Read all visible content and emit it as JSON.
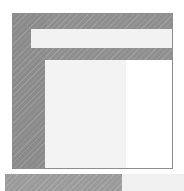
{
  "canvas": {
    "width": 184,
    "height": 191,
    "background_color": "#ffffff",
    "style": "grayscale diagonal-hatch wireframe mockup"
  },
  "window": {
    "name": "application-window-mockup",
    "frame": {
      "label": "window-frame",
      "fill_color": "#8f8f8f",
      "border_color": "#8d8d8d",
      "texture": "diagonal-hatch",
      "x": 12,
      "y": 13,
      "width": 161,
      "height": 156
    },
    "sidebar": {
      "label": "sidebar-panel",
      "fill_color": "#8b8b8b",
      "texture": "diagonal-hatch",
      "x": 13,
      "y": 14,
      "width": 33,
      "height": 154
    },
    "toolbar": {
      "label": "toolbar-strip",
      "fill_color": "#f2f2f2",
      "texture": "diagonal-hatch",
      "x": 31,
      "y": 29,
      "width": 141,
      "height": 19
    },
    "content": {
      "label": "content-panel",
      "x": 45,
      "y": 60,
      "width": 127,
      "height": 108,
      "columns": [
        {
          "label": "content-left-column",
          "fill_color": "#f3f3f3",
          "texture": "diagonal-hatch",
          "width": 81
        },
        {
          "label": "content-right-column",
          "fill_color": "#ffffff",
          "texture": "none",
          "width": 46
        }
      ]
    }
  },
  "bottom_bar": {
    "name": "bottom-bar",
    "x": 5,
    "y": 174,
    "width": 179,
    "height": 17,
    "segments": [
      {
        "label": "bottom-bar-left-segment",
        "fill_color": "#9b9b9b",
        "texture": "diagonal-hatch",
        "width": 117
      },
      {
        "label": "bottom-bar-right-segment",
        "fill_color": "#f0f0f0",
        "texture": "diagonal-hatch",
        "width": 62
      }
    ]
  }
}
